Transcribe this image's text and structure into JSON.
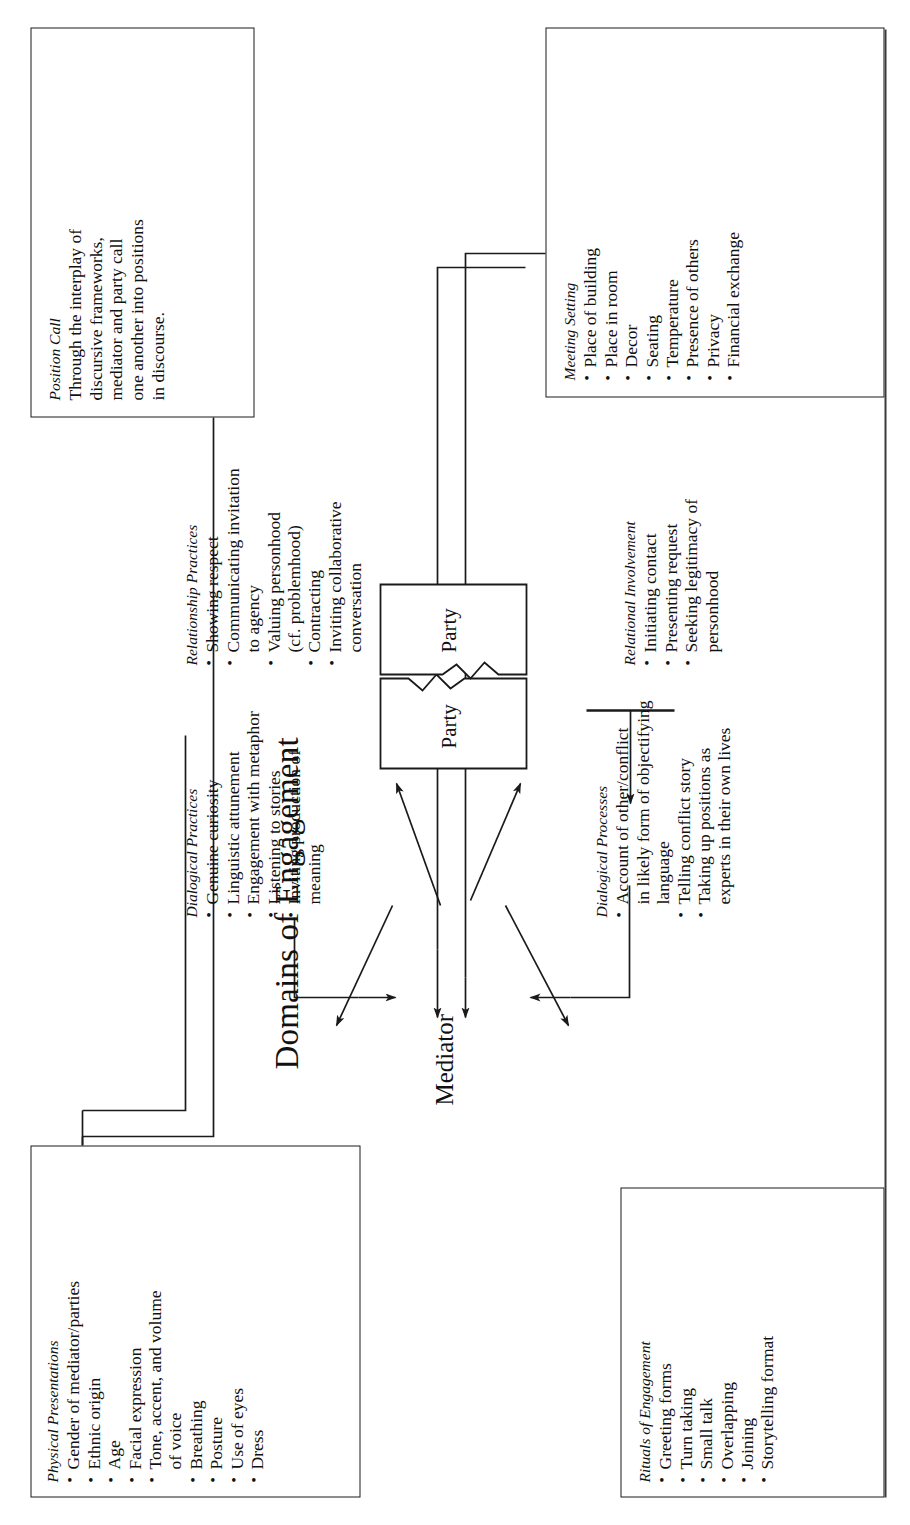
{
  "diagram": {
    "title": "Domains of Engagement",
    "center": {
      "mediator_label": "Mediator",
      "party_a_label": "Party",
      "party_b_label": "Party"
    },
    "boxes": [
      {
        "id": "physical-presentations",
        "heading": "Physical Presentations",
        "boxed": true,
        "items": [
          "Gender of mediator/parties",
          "Ethnic origin",
          "Age",
          "Facial expression",
          "Tone, accent, and volume",
          "of voice",
          "Breathing",
          "Posture",
          "Use of eyes",
          "Dress"
        ],
        "continuation_lines": [
          5
        ]
      },
      {
        "id": "rituals-of-engagement",
        "heading": "Rituals of Engagement",
        "boxed": true,
        "items": [
          "Greeting forms",
          "Turn taking",
          "Small talk",
          "Overlapping",
          "Joining",
          "Storytelling format"
        ],
        "continuation_lines": []
      },
      {
        "id": "dialogical-practices",
        "heading": "Dialogical Practices",
        "boxed": false,
        "items": [
          "Genuine curiosity",
          "Linguistic attunement",
          "Engagement with metaphor",
          "Listening to stories",
          "Inviting production of",
          "meaning"
        ],
        "continuation_lines": [
          5
        ]
      },
      {
        "id": "dialogical-processes",
        "heading": "Dialogical Processes",
        "boxed": false,
        "items": [
          "Account of other/conflict",
          "in likely form of objectifying",
          "language",
          "Telling conflict story",
          "Taking up positions as",
          "experts in their own lives"
        ],
        "continuation_lines": [
          1,
          2,
          5
        ]
      },
      {
        "id": "relationship-practices",
        "heading": "Relationship Practices",
        "boxed": false,
        "items": [
          "Showing respect",
          "Communicating invitation",
          "to agency",
          "Valuing personhood",
          "(cf. problemhood)",
          "Contracting",
          "Inviting collaborative",
          "conversation"
        ],
        "continuation_lines": [
          2,
          4,
          7
        ]
      },
      {
        "id": "relational-involvement",
        "heading": "Relational Involvement",
        "boxed": false,
        "items": [
          "Initiating contact",
          "Presenting request",
          "Seeking legitimacy of",
          "personhood"
        ],
        "continuation_lines": [
          3
        ]
      },
      {
        "id": "position-call",
        "heading": "Position Call",
        "boxed": true,
        "paragraph": "Through the interplay of discursive frameworks, mediator and party call one another into positions in discourse.",
        "paragraph_lines": [
          "Through the interplay of",
          "discursive frameworks,",
          "mediator and party call",
          "one another into positions",
          "in discourse."
        ],
        "items": [],
        "continuation_lines": []
      },
      {
        "id": "meeting-setting",
        "heading": "Meeting Setting",
        "boxed": true,
        "items": [
          "Place of building",
          "Place in room",
          "Decor",
          "Seating",
          "Temperature",
          "Presence of others",
          "Privacy",
          "Financial exchange"
        ],
        "continuation_lines": []
      }
    ]
  },
  "style": {
    "ink": "#1a1a1a",
    "paper": "#ffffff"
  }
}
